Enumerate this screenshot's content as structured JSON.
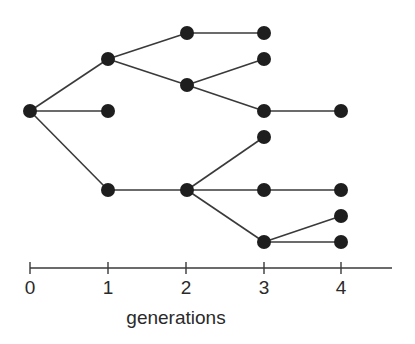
{
  "diagram": {
    "colors": {
      "node": "#1e1e1e",
      "edge": "#3a3a3a",
      "text": "#2a2a2a"
    },
    "nodes": [
      {
        "id": "n0",
        "gen": 0,
        "x": 30,
        "y": 111
      },
      {
        "id": "n1a",
        "gen": 1,
        "x": 108,
        "y": 59
      },
      {
        "id": "n1b",
        "gen": 1,
        "x": 108,
        "y": 111
      },
      {
        "id": "n1c",
        "gen": 1,
        "x": 108,
        "y": 190
      },
      {
        "id": "n2a",
        "gen": 2,
        "x": 187,
        "y": 33
      },
      {
        "id": "n2b",
        "gen": 2,
        "x": 187,
        "y": 85
      },
      {
        "id": "n2c",
        "gen": 2,
        "x": 187,
        "y": 190
      },
      {
        "id": "n3a",
        "gen": 3,
        "x": 264,
        "y": 33
      },
      {
        "id": "n3b",
        "gen": 3,
        "x": 264,
        "y": 59
      },
      {
        "id": "n3c",
        "gen": 3,
        "x": 264,
        "y": 111
      },
      {
        "id": "n3d",
        "gen": 3,
        "x": 264,
        "y": 137
      },
      {
        "id": "n3e",
        "gen": 3,
        "x": 264,
        "y": 190
      },
      {
        "id": "n3f",
        "gen": 3,
        "x": 264,
        "y": 242
      },
      {
        "id": "n4a",
        "gen": 4,
        "x": 341,
        "y": 111
      },
      {
        "id": "n4b",
        "gen": 4,
        "x": 341,
        "y": 190
      },
      {
        "id": "n4c",
        "gen": 4,
        "x": 341,
        "y": 216
      },
      {
        "id": "n4d",
        "gen": 4,
        "x": 341,
        "y": 242
      }
    ],
    "edges": [
      [
        "n0",
        "n1a"
      ],
      [
        "n0",
        "n1b"
      ],
      [
        "n0",
        "n1c"
      ],
      [
        "n1a",
        "n2a"
      ],
      [
        "n1a",
        "n2b"
      ],
      [
        "n1c",
        "n2c"
      ],
      [
        "n2a",
        "n3a"
      ],
      [
        "n2b",
        "n3b"
      ],
      [
        "n2b",
        "n3c"
      ],
      [
        "n2c",
        "n3d"
      ],
      [
        "n2c",
        "n3e"
      ],
      [
        "n2c",
        "n3f"
      ],
      [
        "n3c",
        "n4a"
      ],
      [
        "n3e",
        "n4b"
      ],
      [
        "n3f",
        "n4c"
      ],
      [
        "n3f",
        "n4d"
      ]
    ],
    "axis": {
      "y": 268,
      "x_start": 30,
      "x_end": 392,
      "ticks": [
        {
          "label": "0",
          "x": 30
        },
        {
          "label": "1",
          "x": 108
        },
        {
          "label": "2",
          "x": 186
        },
        {
          "label": "3",
          "x": 264
        },
        {
          "label": "4",
          "x": 341
        }
      ],
      "title": "generations"
    }
  }
}
